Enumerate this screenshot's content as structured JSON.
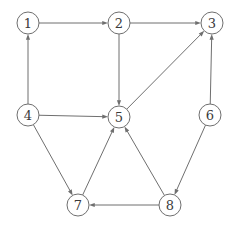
{
  "figure": {
    "kind": "directed-graph",
    "width": 235,
    "height": 230,
    "background_color": "#ffffff",
    "stroke_color": "#6f6f6f",
    "label_color": "#3a3a3a",
    "node_fill": "#ffffff",
    "node_radius": 11,
    "stroke_width": 1,
    "arrow_size": 5
  },
  "nodes": [
    {
      "id": "1",
      "label": "1",
      "x": 28,
      "y": 23
    },
    {
      "id": "2",
      "label": "2",
      "x": 119,
      "y": 23
    },
    {
      "id": "3",
      "label": "3",
      "x": 212,
      "y": 23
    },
    {
      "id": "4",
      "label": "4",
      "x": 28,
      "y": 115
    },
    {
      "id": "5",
      "label": "5",
      "x": 119,
      "y": 117
    },
    {
      "id": "6",
      "label": "6",
      "x": 210,
      "y": 115
    },
    {
      "id": "7",
      "label": "7",
      "x": 78,
      "y": 205
    },
    {
      "id": "8",
      "label": "8",
      "x": 170,
      "y": 205
    }
  ],
  "edges": [
    {
      "id": "e1",
      "from": "1",
      "to": "2",
      "directed": true
    },
    {
      "id": "e2",
      "from": "2",
      "to": "3",
      "directed": true
    },
    {
      "id": "e3",
      "from": "4",
      "to": "1",
      "directed": true
    },
    {
      "id": "e4",
      "from": "2",
      "to": "5",
      "directed": true
    },
    {
      "id": "e5",
      "from": "5",
      "to": "3",
      "directed": true
    },
    {
      "id": "e6",
      "from": "6",
      "to": "3",
      "directed": true
    },
    {
      "id": "e7",
      "from": "4",
      "to": "5",
      "directed": true
    },
    {
      "id": "e8",
      "from": "4",
      "to": "7",
      "directed": true
    },
    {
      "id": "e9",
      "from": "7",
      "to": "5",
      "directed": true
    },
    {
      "id": "e10",
      "from": "8",
      "to": "5",
      "directed": true
    },
    {
      "id": "e11",
      "from": "6",
      "to": "8",
      "directed": true
    },
    {
      "id": "e12",
      "from": "8",
      "to": "7",
      "directed": true
    }
  ]
}
